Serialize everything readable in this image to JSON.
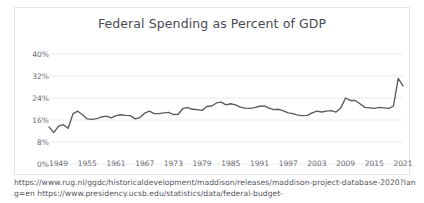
{
  "top_clip": {
    "text": "·  ·   ·    ·     ·      ·      ·      ·"
  },
  "footer": {
    "source_text": "https://www.rug.nl/ggdc/historicaldevelopment/maddison/releases/maddison-project-database-2020?lang=en https://www.presidency.ucsb.edu/statistics/data/federal-budget-"
  },
  "chart_data": {
    "type": "line",
    "title": "Federal Spending as Percent of GDP",
    "xlabel": "",
    "ylabel": "",
    "ylim": [
      0,
      40
    ],
    "xlim": [
      1947,
      2021
    ],
    "grid": true,
    "legend": false,
    "line_color": "#595961",
    "grid_color": "#ececed",
    "background": "#ffffff",
    "ytick_labels": [
      "0%",
      "8%",
      "16%",
      "24%",
      "32%",
      "40%"
    ],
    "ytick_values": [
      0,
      8,
      16,
      24,
      32,
      40
    ],
    "xtick_labels": [
      "1949",
      "1955",
      "1961",
      "1967",
      "1973",
      "1979",
      "1985",
      "1991",
      "1997",
      "2003",
      "2009",
      "2015",
      "2021"
    ],
    "xtick_values": [
      1949,
      1955,
      1961,
      1967,
      1973,
      1979,
      1985,
      1991,
      1997,
      2003,
      2009,
      2015,
      2021
    ],
    "x": [
      1947,
      1948,
      1949,
      1950,
      1951,
      1952,
      1953,
      1954,
      1955,
      1956,
      1957,
      1958,
      1959,
      1960,
      1961,
      1962,
      1963,
      1964,
      1965,
      1966,
      1967,
      1968,
      1969,
      1970,
      1971,
      1972,
      1973,
      1974,
      1975,
      1976,
      1977,
      1978,
      1979,
      1980,
      1981,
      1982,
      1983,
      1984,
      1985,
      1986,
      1987,
      1988,
      1989,
      1990,
      1991,
      1992,
      1993,
      1994,
      1995,
      1996,
      1997,
      1998,
      1999,
      2000,
      2001,
      2002,
      2003,
      2004,
      2005,
      2006,
      2007,
      2008,
      2009,
      2010,
      2011,
      2012,
      2013,
      2014,
      2015,
      2016,
      2017,
      2018,
      2019,
      2020,
      2021
    ],
    "values": [
      13.5,
      11.4,
      13.8,
      14.3,
      13.0,
      18.2,
      19.2,
      17.9,
      16.4,
      16.2,
      16.5,
      17.1,
      17.4,
      16.8,
      17.6,
      17.9,
      17.7,
      17.6,
      16.4,
      16.9,
      18.5,
      19.2,
      18.3,
      18.3,
      18.6,
      18.8,
      18.0,
      18.1,
      20.2,
      20.5,
      19.9,
      19.8,
      19.5,
      20.9,
      21.1,
      22.2,
      22.5,
      21.5,
      21.9,
      21.5,
      20.7,
      20.3,
      20.2,
      20.5,
      21.0,
      21.1,
      20.3,
      19.8,
      19.9,
      19.3,
      18.6,
      18.3,
      17.8,
      17.6,
      17.7,
      18.6,
      19.2,
      18.9,
      19.2,
      19.4,
      18.9,
      20.4,
      24.0,
      23.1,
      23.1,
      21.9,
      20.6,
      20.4,
      20.2,
      20.6,
      20.4,
      20.2,
      21.0,
      31.1,
      28.4
    ],
    "annotations": []
  }
}
